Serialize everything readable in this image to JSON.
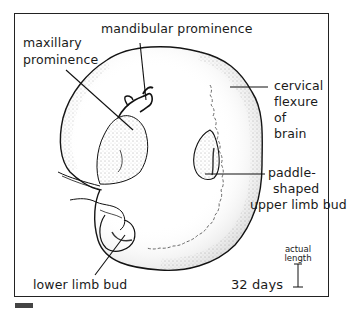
{
  "figure": {
    "age_label": "32 days",
    "scale": {
      "label_line1": "actual",
      "label_line2": "length"
    },
    "labels": {
      "mandibular": "mandibular prominence",
      "maxillary_line1": "maxillary",
      "maxillary_line2": "prominence",
      "cervical_line1": "cervical",
      "cervical_line2": "flexure",
      "cervical_line3": "of",
      "cervical_line4": "brain",
      "upper_limb_line1": "paddle-",
      "upper_limb_line2": "shaped",
      "upper_limb_line3": "upper limb bud",
      "lower_limb": "lower limb bud"
    },
    "colors": {
      "ink": "#1a1a1a",
      "frame": "#222222",
      "background": "#ffffff"
    }
  }
}
